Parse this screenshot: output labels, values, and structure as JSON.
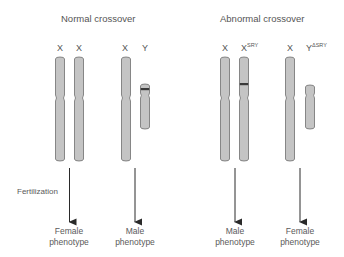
{
  "panels": {
    "normal": {
      "title": "Normal crossover",
      "pairs": [
        {
          "labels": [
            "X",
            "X"
          ],
          "phenotype": [
            "Female",
            "phenotype"
          ]
        },
        {
          "labels": [
            "X",
            "Y"
          ],
          "phenotype": [
            "Male",
            "phenotype"
          ]
        }
      ]
    },
    "abnormal": {
      "title": "Abnormal crossover",
      "pairs": [
        {
          "labels": [
            "X",
            "X"
          ],
          "superscripts": [
            "",
            "SRY"
          ],
          "phenotype": [
            "Male",
            "phenotype"
          ]
        },
        {
          "labels": [
            "X",
            "Y"
          ],
          "superscripts": [
            "",
            "ΔSRY"
          ],
          "phenotype": [
            "Female",
            "phenotype"
          ]
        }
      ]
    }
  },
  "fertilization_label": "Fertilization",
  "colors": {
    "chromosome_fill": "#c4c4c4",
    "chromosome_stroke": "#6e6e6e",
    "sry_band": "#3a3a3a",
    "arrow": "#2a2a2a",
    "text": "#555555"
  }
}
